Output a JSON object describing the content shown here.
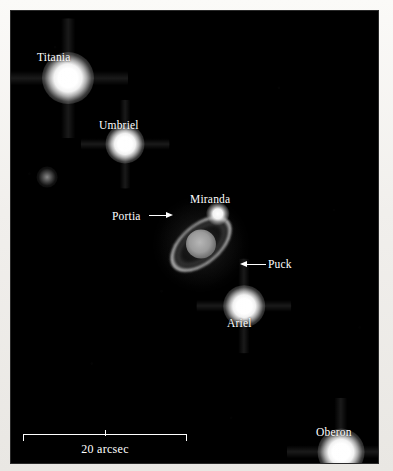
{
  "figure": {
    "background_color": "#f4f2ef",
    "sky_color": "#000000",
    "label_color": "#ffffff"
  },
  "objects": [
    {
      "name": "Titania",
      "label": "Titania",
      "kind": "moon",
      "brightness": "bright",
      "x": 68,
      "y": 78,
      "size": 20,
      "label_x": 37,
      "label_y": 52
    },
    {
      "name": "Umbriel",
      "label": "Umbriel",
      "kind": "moon",
      "brightness": "bright",
      "x": 125,
      "y": 144,
      "size": 15,
      "label_x": 99,
      "label_y": 120
    },
    {
      "name": "unlabeled-faint-moon",
      "label": "",
      "kind": "moon",
      "brightness": "faint",
      "x": 47,
      "y": 177,
      "size": 8,
      "label_x": null,
      "label_y": null
    },
    {
      "name": "Miranda",
      "label": "Miranda",
      "kind": "moon",
      "brightness": "mid",
      "x": 218,
      "y": 214,
      "size": 9,
      "label_x": 190,
      "label_y": 194
    },
    {
      "name": "Ariel",
      "label": "Ariel",
      "kind": "moon",
      "brightness": "bright",
      "x": 244,
      "y": 306,
      "size": 16,
      "label_x": 227,
      "label_y": 318
    },
    {
      "name": "Oberon",
      "label": "Oberon",
      "kind": "moon",
      "brightness": "bright",
      "x": 341,
      "y": 452,
      "size": 18,
      "label_x": 316,
      "label_y": 427
    }
  ],
  "planet": {
    "name": "Uranus",
    "center_x": 201,
    "center_y": 244,
    "ring_tilt_deg": -40
  },
  "annotations": [
    {
      "name": "Portia",
      "label": "Portia",
      "direction": "right",
      "label_x": 112,
      "label_y": 211,
      "arrow_x": 149,
      "arrow_y": 211,
      "arrow_length": 24
    },
    {
      "name": "Puck",
      "label": "Puck",
      "direction": "left",
      "label_x": 268,
      "label_y": 259,
      "arrow_x": 240,
      "arrow_y": 260,
      "arrow_length": 26
    }
  ],
  "scale_bar": {
    "label": "20 arcsec",
    "x": 23,
    "y": 434,
    "width": 164,
    "ticks": 3
  }
}
